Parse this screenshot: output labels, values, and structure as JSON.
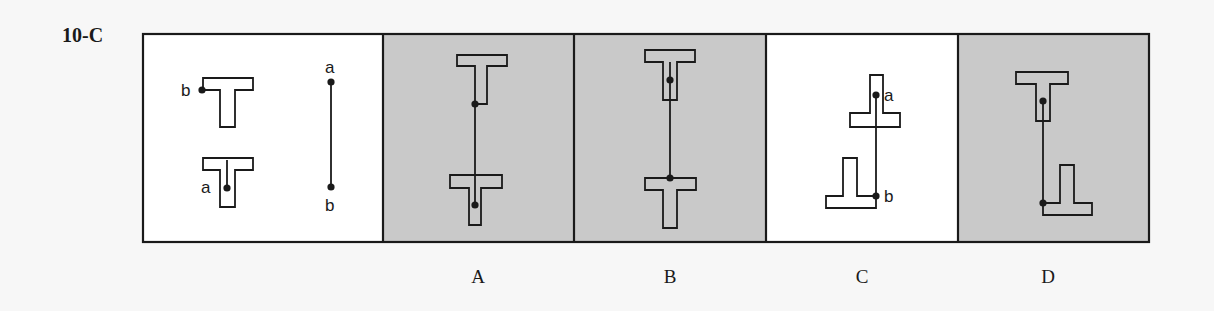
{
  "problem": {
    "id": "10-C"
  },
  "panels": {
    "stimulus": {
      "label_a": "a",
      "label_b": "b",
      "line_label_a": "a",
      "line_label_b": "b",
      "background": "#ffffff"
    },
    "choices": [
      {
        "letter": "A",
        "background": "#c9c9c9"
      },
      {
        "letter": "B",
        "background": "#c9c9c9"
      },
      {
        "letter": "C",
        "background": "#ffffff",
        "point_label_a": "a",
        "point_label_b": "b"
      },
      {
        "letter": "D",
        "background": "#c9c9c9"
      }
    ]
  },
  "colors": {
    "stroke": "#1a1a1a",
    "shaded": "#c9c9c9",
    "page": "#f7f7f7"
  }
}
